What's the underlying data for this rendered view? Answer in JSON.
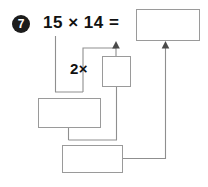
{
  "worksheet": {
    "problem_number": "7",
    "equation": "15 × 14 =",
    "multiplier_label": "2×",
    "boxes": [
      {
        "name": "product-answer-box",
        "value": ""
      },
      {
        "name": "small-answer-box",
        "value": ""
      },
      {
        "name": "wide-answer-box",
        "value": ""
      },
      {
        "name": "bottom-answer-box",
        "value": ""
      }
    ]
  },
  "colors": {
    "box_border": "#9a9a9a",
    "wire": "#8f8f8f",
    "arrow": "#4a4a4a",
    "text": "#111111",
    "bullet_fill": "#1c1c1c",
    "bullet_text": "#ffffff",
    "page_background": "#ffffff"
  }
}
